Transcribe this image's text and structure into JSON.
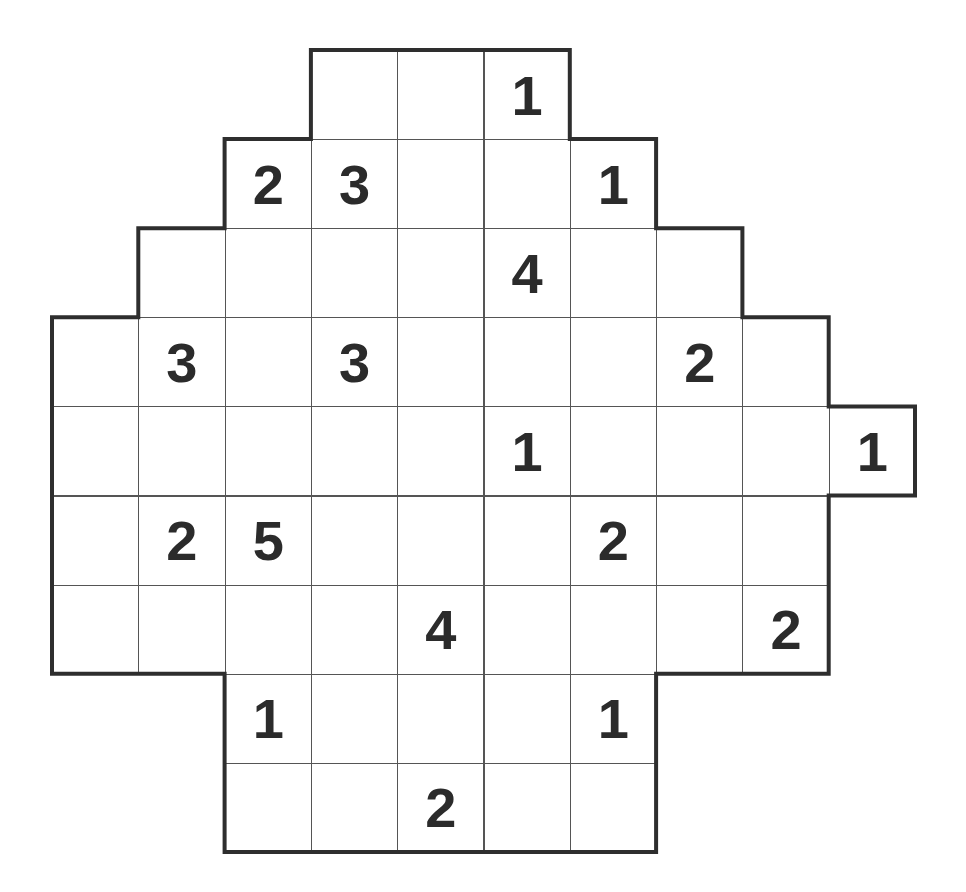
{
  "puzzle": {
    "grid": {
      "cols": 10,
      "rows": 9,
      "origin_x": 52,
      "origin_y": 50,
      "cell_w": 86.3,
      "cell_h": 89.1
    },
    "colors": {
      "line": "#555555",
      "outline": "#2e2e2e",
      "digit": "#2b2b2b",
      "background": "#ffffff"
    },
    "rows": [
      {
        "cols": [
          3,
          4,
          5
        ],
        "clues": {
          "5": "1"
        }
      },
      {
        "cols": [
          2,
          3,
          4,
          5,
          6
        ],
        "clues": {
          "2": "2",
          "3": "3",
          "6": "1"
        }
      },
      {
        "cols": [
          1,
          2,
          3,
          4,
          5,
          6,
          7
        ],
        "clues": {
          "5": "4"
        }
      },
      {
        "cols": [
          0,
          1,
          2,
          3,
          4,
          5,
          6,
          7,
          8
        ],
        "clues": {
          "1": "3",
          "3": "3",
          "7": "2"
        }
      },
      {
        "cols": [
          0,
          1,
          2,
          3,
          4,
          5,
          6,
          7,
          8,
          9
        ],
        "clues": {
          "5": "1",
          "9": "1"
        }
      },
      {
        "cols": [
          0,
          1,
          2,
          3,
          4,
          5,
          6,
          7,
          8
        ],
        "clues": {
          "1": "2",
          "2": "5",
          "6": "2"
        }
      },
      {
        "cols": [
          0,
          1,
          2,
          3,
          4,
          5,
          6,
          7,
          8
        ],
        "clues": {
          "4": "4",
          "8": "2"
        }
      },
      {
        "cols": [
          2,
          3,
          4,
          5,
          6
        ],
        "clues": {
          "2": "1",
          "6": "1"
        }
      },
      {
        "cols": [
          2,
          3,
          4,
          5,
          6
        ],
        "clues": {
          "4": "2"
        }
      }
    ],
    "outline_points": [
      [
        3,
        0
      ],
      [
        6,
        0
      ],
      [
        6,
        1
      ],
      [
        7,
        1
      ],
      [
        7,
        2
      ],
      [
        8,
        2
      ],
      [
        8,
        3
      ],
      [
        9,
        3
      ],
      [
        9,
        4
      ],
      [
        10,
        4
      ],
      [
        10,
        5
      ],
      [
        9,
        5
      ],
      [
        9,
        7
      ],
      [
        7,
        7
      ],
      [
        7,
        9
      ],
      [
        2,
        9
      ],
      [
        2,
        7
      ],
      [
        0,
        7
      ],
      [
        0,
        3
      ],
      [
        1,
        3
      ],
      [
        1,
        2
      ],
      [
        2,
        2
      ],
      [
        2,
        1
      ],
      [
        3,
        1
      ]
    ]
  }
}
